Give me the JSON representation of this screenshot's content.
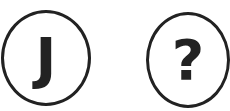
{
  "icons": [
    {
      "name": "letter-j-icon",
      "glyph": "J"
    },
    {
      "name": "question-mark-icon",
      "glyph": "?"
    }
  ],
  "colors": {
    "stroke": "#222222",
    "background": "#ffffff"
  }
}
